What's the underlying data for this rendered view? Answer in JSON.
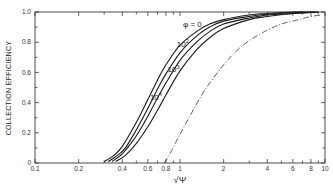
{
  "chart_data": {
    "type": "line",
    "title": "",
    "xlabel": "√Ψ",
    "ylabel": "COLLECTION EFFICIENCY",
    "xscale": "log",
    "xlim": [
      0.1,
      10
    ],
    "ylim": [
      0,
      1.0
    ],
    "grid": false,
    "x_ticks": [
      {
        "value": 0.1,
        "label": "0.1"
      },
      {
        "value": 0.2,
        "label": "0.2"
      },
      {
        "value": 0.3,
        "label": ""
      },
      {
        "value": 0.4,
        "label": "0.4"
      },
      {
        "value": 0.5,
        "label": ""
      },
      {
        "value": 0.6,
        "label": "0.6"
      },
      {
        "value": 0.7,
        "label": ""
      },
      {
        "value": 0.8,
        "label": "0.8"
      },
      {
        "value": 0.9,
        "label": ""
      },
      {
        "value": 1,
        "label": "1"
      },
      {
        "value": 2,
        "label": "2"
      },
      {
        "value": 3,
        "label": ""
      },
      {
        "value": 4,
        "label": "4"
      },
      {
        "value": 5,
        "label": ""
      },
      {
        "value": 6,
        "label": "6"
      },
      {
        "value": 7,
        "label": ""
      },
      {
        "value": 8,
        "label": "8"
      },
      {
        "value": 9,
        "label": ""
      },
      {
        "value": 10,
        "label": "10"
      }
    ],
    "y_ticks": [
      {
        "value": 0,
        "label": "0"
      },
      {
        "value": 0.1,
        "label": ""
      },
      {
        "value": 0.2,
        "label": "0.2"
      },
      {
        "value": 0.3,
        "label": ""
      },
      {
        "value": 0.4,
        "label": "0.4"
      },
      {
        "value": 0.5,
        "label": ""
      },
      {
        "value": 0.6,
        "label": "0.6"
      },
      {
        "value": 0.7,
        "label": ""
      },
      {
        "value": 0.8,
        "label": "0.8"
      },
      {
        "value": 0.9,
        "label": ""
      },
      {
        "value": 1.0,
        "label": "1.0"
      }
    ],
    "series": [
      {
        "name": "φ = 0",
        "label_base": "φ = 0",
        "label_sup": "",
        "style": "solid",
        "x": [
          0.3,
          0.35,
          0.4,
          0.5,
          0.6,
          0.7,
          0.8,
          1.0,
          1.3,
          1.6,
          2.0,
          3.0,
          4.0,
          6.0,
          8.0
        ],
        "y": [
          0.01,
          0.05,
          0.11,
          0.27,
          0.42,
          0.55,
          0.65,
          0.78,
          0.87,
          0.92,
          0.95,
          0.98,
          0.99,
          1.0,
          1.0
        ]
      },
      {
        "name": "10²",
        "label_base": "10",
        "label_sup": "2",
        "style": "solid",
        "x": [
          0.32,
          0.37,
          0.42,
          0.5,
          0.6,
          0.7,
          0.8,
          1.0,
          1.3,
          1.6,
          2.0,
          3.0,
          4.0,
          6.0,
          8.5
        ],
        "y": [
          0.01,
          0.05,
          0.1,
          0.22,
          0.36,
          0.49,
          0.59,
          0.73,
          0.84,
          0.9,
          0.94,
          0.97,
          0.985,
          0.995,
          1.0
        ]
      },
      {
        "name": "10³",
        "label_base": "10",
        "label_sup": "3",
        "style": "solid",
        "x": [
          0.34,
          0.4,
          0.45,
          0.5,
          0.6,
          0.7,
          0.8,
          1.0,
          1.3,
          1.6,
          2.0,
          3.0,
          4.0,
          6.0,
          9.0
        ],
        "y": [
          0.01,
          0.06,
          0.12,
          0.18,
          0.31,
          0.43,
          0.53,
          0.68,
          0.8,
          0.87,
          0.92,
          0.96,
          0.98,
          0.99,
          1.0
        ]
      },
      {
        "name": "10⁴",
        "label_base": "10",
        "label_sup": "4",
        "style": "solid",
        "x": [
          0.36,
          0.42,
          0.5,
          0.6,
          0.7,
          0.8,
          1.0,
          1.3,
          1.6,
          2.0,
          3.0,
          4.0,
          6.0,
          9.0
        ],
        "y": [
          0.01,
          0.05,
          0.13,
          0.24,
          0.35,
          0.45,
          0.61,
          0.75,
          0.83,
          0.89,
          0.95,
          0.97,
          0.99,
          1.0
        ]
      },
      {
        "name": "limit",
        "label_base": "",
        "label_sup": "",
        "style": "dash-dot",
        "x": [
          0.78,
          0.85,
          1.0,
          1.2,
          1.5,
          2.0,
          2.5,
          3.0,
          4.0,
          5.0,
          6.0,
          8.0,
          9.5
        ],
        "y": [
          0.0,
          0.06,
          0.19,
          0.33,
          0.49,
          0.65,
          0.75,
          0.81,
          0.88,
          0.92,
          0.94,
          0.97,
          0.98
        ]
      }
    ],
    "annotations": [
      {
        "text": "φ = 0",
        "x": 1.05,
        "y": 0.9
      },
      {
        "text": "10²",
        "x": 0.95,
        "y": 0.77
      },
      {
        "text": "10³",
        "x": 0.82,
        "y": 0.6
      },
      {
        "text": "10⁴",
        "x": 0.62,
        "y": 0.42
      }
    ]
  }
}
